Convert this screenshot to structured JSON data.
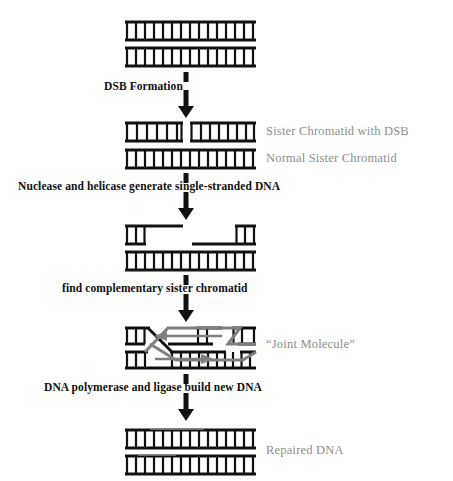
{
  "diagram": {
    "title_visible": false,
    "palette": {
      "strand_black": "#111111",
      "strand_gray": "#7f7f7f",
      "label_gray": "#8d8d8d",
      "caption_black": "#100f0f",
      "background": "#ffffff"
    },
    "duplex_geometry": {
      "left_x": 125,
      "right_x": 256,
      "rung_count_full": 14
    },
    "stages": [
      {
        "id": "stage-intact",
        "name": "intact-sister-chromatids",
        "top_y": 22,
        "bottom_y": 48,
        "side_labels": []
      },
      {
        "id": "stage-dsb",
        "name": "sister-chromatid-with-dsb",
        "top_y": 123,
        "bottom_y": 150,
        "side_labels": [
          "Sister Chromatid with DSB",
          "Normal Sister Chromatid"
        ]
      },
      {
        "id": "stage-resected",
        "name": "single-stranded-resection",
        "top_y": 226,
        "bottom_y": 252,
        "side_labels": []
      },
      {
        "id": "stage-joint",
        "name": "joint-molecule",
        "top_y": 328,
        "bottom_y": 352,
        "side_labels": [
          "“Joint Molecule”"
        ]
      },
      {
        "id": "stage-repaired",
        "name": "repaired-dna",
        "top_y": 430,
        "bottom_y": 456,
        "side_labels": [
          "Repaired DNA"
        ]
      }
    ],
    "captions": [
      {
        "key": "dsb_formation",
        "text": "DSB Formation",
        "x": 104,
        "y": 79
      },
      {
        "key": "nuclease_helicase",
        "text": "Nuclease and helicase generate single-stranded DNA",
        "x": 18,
        "y": 180
      },
      {
        "key": "find_complementary",
        "text": "find complementary sister chromatid",
        "x": 62,
        "y": 282
      },
      {
        "key": "polymerase_ligase",
        "text": "DNA polymerase and ligase build new DNA",
        "x": 44,
        "y": 381
      }
    ],
    "labels": {
      "sister_chromatid_with_dsb": "Sister Chromatid with DSB",
      "normal_sister_chromatid": "Normal Sister Chromatid",
      "joint_molecule": "“Joint Molecule”",
      "repaired_dna": "Repaired DNA"
    },
    "arrows": [
      {
        "key": "arrow1",
        "x": 186,
        "y": 62,
        "label_for": "DSB Formation"
      },
      {
        "key": "arrow2",
        "x": 186,
        "y": 163,
        "label_for": "Nuclease and helicase generate single-stranded DNA"
      },
      {
        "key": "arrow3",
        "x": 186,
        "y": 265,
        "label_for": "find complementary sister chromatid"
      },
      {
        "key": "arrow4",
        "x": 186,
        "y": 364,
        "label_for": "DNA polymerase and ligase build new DNA"
      }
    ],
    "strand_arrows": {
      "upper_leftward": "synthesis direction leftward on invading strand",
      "lower_rightward": "synthesis direction rightward on invading strand"
    }
  }
}
